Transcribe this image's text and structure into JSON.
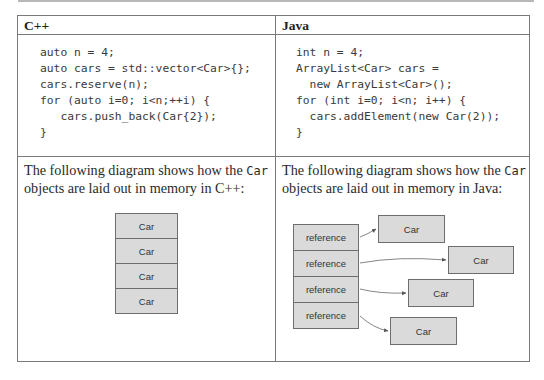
{
  "table": {
    "columns": [
      {
        "header": "C++",
        "code_lines": [
          "auto n = 4;",
          "auto cars = std::vector<Car>{};",
          "cars.reserve(n);",
          "for (auto i=0; i<n;++i) {",
          "   cars.push_back(Car{2});",
          "}"
        ],
        "description": {
          "prefix": "The following diagram shows how the ",
          "code_term": "Car",
          "suffix": " objects are laid out in memory in C++:"
        },
        "diagram": {
          "type": "contiguous",
          "boxes": [
            "Car",
            "Car",
            "Car",
            "Car"
          ]
        }
      },
      {
        "header": "Java",
        "code_lines": [
          "int n = 4;",
          "ArrayList<Car> cars =",
          "  new ArrayList<Car>();",
          "for (int i=0; i<n; i++) {",
          "  cars.addElement(new Car(2));",
          "}"
        ],
        "description": {
          "prefix": "The following diagram shows how the ",
          "code_term": "Car",
          "suffix": " objects are laid out in memory in Java:"
        },
        "diagram": {
          "type": "references",
          "references": [
            "reference",
            "reference",
            "reference",
            "reference"
          ],
          "objects": [
            "Car",
            "Car",
            "Car",
            "Car"
          ]
        }
      }
    ]
  },
  "colors": {
    "border": "#7a7a7a",
    "box_fill": "#dadada",
    "box_border": "#6e6e6e",
    "arrow": "#555555"
  }
}
